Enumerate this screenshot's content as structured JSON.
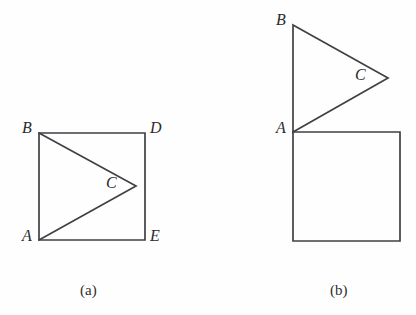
{
  "canvas": {
    "width": 416,
    "height": 315,
    "background_color": "#fefefe",
    "stroke_color": "#404046",
    "label_color": "#2b2b2b"
  },
  "figures": [
    {
      "id": "figure-a",
      "caption": "(a)",
      "caption_pos": {
        "x": 80,
        "y": 283
      },
      "square": {
        "name": "square-abde",
        "corners": {
          "top_left": {
            "x": 39,
            "y": 133
          },
          "top_right": {
            "x": 145,
            "y": 133
          },
          "bottom_right": {
            "x": 145,
            "y": 240
          },
          "bottom_left": {
            "x": 39,
            "y": 240
          }
        }
      },
      "triangle": {
        "name": "triangle-abc",
        "points": [
          {
            "label": "B",
            "x": 39,
            "y": 133
          },
          {
            "label": "C",
            "x": 136,
            "y": 186
          },
          {
            "label": "A",
            "x": 39,
            "y": 240
          }
        ]
      },
      "labels": [
        {
          "name": "vertex-label-b",
          "text": "B",
          "x": 22,
          "y": 120
        },
        {
          "name": "vertex-label-d",
          "text": "D",
          "x": 150,
          "y": 120
        },
        {
          "name": "vertex-label-a",
          "text": "A",
          "x": 22,
          "y": 228
        },
        {
          "name": "vertex-label-e",
          "text": "E",
          "x": 150,
          "y": 228
        },
        {
          "name": "vertex-label-c",
          "text": "C",
          "x": 106,
          "y": 175
        }
      ]
    },
    {
      "id": "figure-b",
      "caption": "(b)",
      "caption_pos": {
        "x": 330,
        "y": 283
      },
      "square": {
        "name": "square-below",
        "corners": {
          "top_left": {
            "x": 293,
            "y": 132
          },
          "top_right": {
            "x": 400,
            "y": 132
          },
          "bottom_right": {
            "x": 400,
            "y": 241
          },
          "bottom_left": {
            "x": 293,
            "y": 241
          }
        }
      },
      "triangle": {
        "name": "triangle-abc",
        "points": [
          {
            "label": "B",
            "x": 293,
            "y": 25
          },
          {
            "label": "C",
            "x": 388,
            "y": 78
          },
          {
            "label": "A",
            "x": 293,
            "y": 132
          }
        ]
      },
      "labels": [
        {
          "name": "vertex-label-b",
          "text": "B",
          "x": 276,
          "y": 12
        },
        {
          "name": "vertex-label-a",
          "text": "A",
          "x": 276,
          "y": 120
        },
        {
          "name": "vertex-label-c",
          "text": "C",
          "x": 355,
          "y": 67
        }
      ]
    }
  ]
}
